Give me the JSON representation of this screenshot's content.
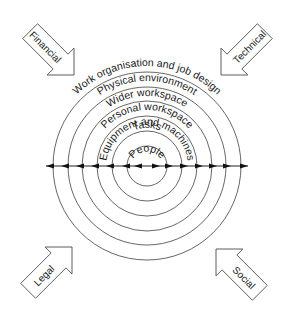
{
  "diagram": {
    "type": "concentric-layers",
    "center": {
      "x": 147,
      "y": 166
    },
    "layers": [
      {
        "label": "People",
        "radius": 20
      },
      {
        "label": "Tasks",
        "radius": 35
      },
      {
        "label": "Equipment and machines",
        "radius": 50
      },
      {
        "label": "Personal workspace",
        "radius": 65
      },
      {
        "label": "Wider workspace",
        "radius": 79
      },
      {
        "label": "Physical environment",
        "radius": 94
      },
      {
        "label": "Work organisation and job design",
        "radius": 109
      }
    ],
    "axis": {
      "description": "bidirectional horizontal axis through all layers",
      "arrowheads_left": 6,
      "arrowheads_right": 6
    },
    "forces": [
      {
        "label": "Financial",
        "position": "top-left",
        "direction": "inward"
      },
      {
        "label": "Technical",
        "position": "top-right",
        "direction": "inward"
      },
      {
        "label": "Legal",
        "position": "bottom-left",
        "direction": "inward"
      },
      {
        "label": "Social",
        "position": "bottom-right",
        "direction": "inward"
      }
    ],
    "colors": {
      "stroke": "#555555",
      "text": "#1a1a1a",
      "background": "#ffffff"
    }
  }
}
